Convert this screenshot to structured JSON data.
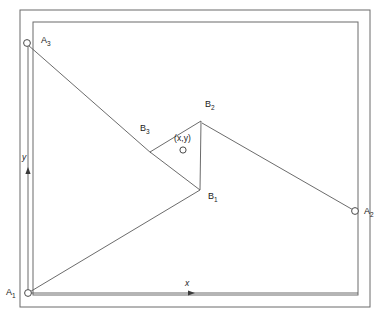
{
  "figure": {
    "type": "geometry-diagram",
    "stroke_color": "#555555",
    "text_color": "#1a1a1a",
    "background_color": "#ffffff"
  },
  "frames": {
    "outer": {
      "x": 20,
      "y": 10,
      "width": 350,
      "height": 297
    },
    "inner": {
      "x": 33,
      "y": 22,
      "width": 325,
      "height": 273
    }
  },
  "anchors": [
    {
      "id": "A1",
      "label": "A",
      "sub": "1",
      "cx": 28,
      "cy": 293,
      "r": 3.4,
      "label_x": 6,
      "label_y": 288
    },
    {
      "id": "A2",
      "label": "A",
      "sub": "2",
      "cx": 355,
      "cy": 211,
      "r": 3.4,
      "label_x": 364,
      "label_y": 207
    },
    {
      "id": "A3",
      "label": "A",
      "sub": "3",
      "cx": 27,
      "cy": 43,
      "r": 3.4,
      "label_x": 41,
      "label_y": 36
    }
  ],
  "triangle": {
    "vertices": [
      {
        "id": "B1",
        "label": "B",
        "sub": "1",
        "x": 200,
        "y": 190,
        "label_x": 208,
        "label_y": 192
      },
      {
        "id": "B2",
        "label": "B",
        "sub": "2",
        "x": 201,
        "y": 121,
        "label_x": 205,
        "label_y": 100
      },
      {
        "id": "B3",
        "label": "B",
        "sub": "3",
        "x": 150,
        "y": 152,
        "label_x": 140,
        "label_y": 124
      }
    ]
  },
  "centroid_marker": {
    "label": "(x,y)",
    "label_x": 174,
    "label_y": 134,
    "cx": 183,
    "cy": 150,
    "r": 3.1
  },
  "connectors": [
    {
      "from": "A1",
      "to": "B1",
      "x1": 28,
      "y1": 293,
      "x2": 200,
      "y2": 190
    },
    {
      "from": "A2",
      "to": "B2",
      "x1": 355,
      "y1": 211,
      "x2": 202,
      "y2": 123
    },
    {
      "from": "A3",
      "to": "B3",
      "x1": 28,
      "y1": 45,
      "x2": 151,
      "y2": 153
    }
  ],
  "axes": {
    "x_axis": {
      "label": "x",
      "label_x": 185,
      "label_y": 279,
      "x1": 28,
      "y1": 293,
      "x2": 358,
      "y2": 293,
      "arrow_x": 190,
      "arrow_y": 293
    },
    "y_axis": {
      "label": "y",
      "label_x": 22,
      "label_y": 153,
      "x1": 28,
      "y1": 293,
      "x2": 28,
      "y2": 45,
      "arrow_x": 28,
      "arrow_y": 172
    }
  }
}
